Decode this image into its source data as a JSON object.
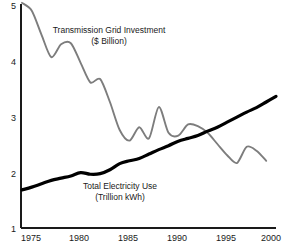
{
  "chart_data": {
    "type": "line",
    "title": "",
    "subtitle": "",
    "xlabel": "",
    "ylabel": "",
    "xlim": [
      1974,
      2000
    ],
    "ylim": [
      1,
      5
    ],
    "grid": false,
    "legend_position": "inline-annotations",
    "xticks": [
      "1975",
      "1980",
      "1985",
      "1990",
      "1995",
      "2000"
    ],
    "xtick_values": [
      1975,
      1980,
      1985,
      1990,
      1995,
      2000
    ],
    "yticks": [
      "1",
      "2",
      "3",
      "4",
      "5"
    ],
    "ytick_values": [
      1,
      2,
      3,
      4,
      5
    ],
    "x": [
      1974,
      1975,
      1976,
      1977,
      1978,
      1979,
      1980,
      1981,
      1982,
      1983,
      1984,
      1985,
      1986,
      1987,
      1988,
      1989,
      1990,
      1991,
      1992,
      1993,
      1994,
      1995,
      1996,
      1997,
      1998,
      1999,
      2000
    ],
    "series": [
      {
        "name": "Transmission Grid Investment",
        "unit": "$ Billion",
        "color": "#7d7d7d",
        "x": [
          1974,
          1975,
          1976,
          1977,
          1978,
          1979,
          1980,
          1981,
          1982,
          1983,
          1984,
          1985,
          1986,
          1987,
          1988,
          1989,
          1990,
          1991,
          1992,
          1993,
          1994,
          1995,
          1996,
          1997,
          1998,
          1999
        ],
        "values": [
          5.02,
          4.88,
          4.45,
          4.05,
          4.28,
          4.3,
          3.95,
          3.6,
          3.66,
          3.25,
          2.75,
          2.56,
          2.8,
          2.6,
          3.16,
          2.7,
          2.65,
          2.85,
          2.82,
          2.7,
          2.5,
          2.3,
          2.16,
          2.45,
          2.38,
          2.2
        ]
      },
      {
        "name": "Total Electricity Use",
        "unit": "Trillion kWh",
        "color": "#000000",
        "x": [
          1974,
          1975,
          1976,
          1977,
          1978,
          1979,
          1980,
          1981,
          1982,
          1983,
          1984,
          1985,
          1986,
          1987,
          1988,
          1989,
          1990,
          1991,
          1992,
          1993,
          1994,
          1995,
          1996,
          1997,
          1998,
          1999,
          2000
        ],
        "values": [
          1.68,
          1.73,
          1.79,
          1.85,
          1.89,
          1.93,
          1.99,
          1.96,
          1.97,
          2.04,
          2.15,
          2.2,
          2.24,
          2.32,
          2.4,
          2.47,
          2.55,
          2.6,
          2.65,
          2.73,
          2.8,
          2.89,
          2.98,
          3.07,
          3.15,
          3.25,
          3.35
        ]
      }
    ],
    "annotations": [
      {
        "name": "transmission-grid-investment-annotation",
        "line1": "Transmission Grid Investment",
        "line2": "($ Billion)"
      },
      {
        "name": "total-electricity-use-annotation",
        "line1": "Total Electricity Use",
        "line2": "(Trillion kWh)"
      }
    ]
  },
  "axes": {
    "y_tick_1": "1",
    "y_tick_2": "2",
    "y_tick_3": "3",
    "y_tick_4": "4",
    "y_tick_5": "5",
    "x_tick_1975": "1975",
    "x_tick_1980": "1980",
    "x_tick_1985": "1985",
    "x_tick_1990": "1990",
    "x_tick_1995": "1995",
    "x_tick_2000": "2000"
  },
  "annotation_text": {
    "grid_line1": "Transmission Grid Investment",
    "grid_line2": "($ Billion)",
    "use_line1": "Total Electricity Use",
    "use_line2": "(Trillion kWh)"
  }
}
